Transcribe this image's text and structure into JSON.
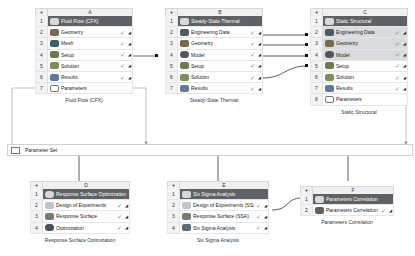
{
  "systems": {
    "A": {
      "letter": "A",
      "caption": "Fluid Flow (CFX)",
      "rows": [
        {
          "num": "1",
          "label": "Fluid Flow (CFX)",
          "icon": "fluid-flow-icon"
        },
        {
          "num": "2",
          "label": "Geometry",
          "icon": "geometry-icon",
          "check": "✓",
          "corner": "◢"
        },
        {
          "num": "3",
          "label": "Mesh",
          "icon": "mesh-icon",
          "check": "✓",
          "corner": "◢"
        },
        {
          "num": "4",
          "label": "Setup",
          "icon": "setup-icon",
          "check": "✓",
          "corner": "◢"
        },
        {
          "num": "5",
          "label": "Solution",
          "icon": "solution-icon",
          "check": "✓",
          "corner": "◢"
        },
        {
          "num": "6",
          "label": "Results",
          "icon": "results-icon",
          "check": "✓",
          "corner": "◢"
        },
        {
          "num": "7",
          "label": "Parameters",
          "icon": "parameters-icon"
        }
      ]
    },
    "B": {
      "letter": "B",
      "caption": "Steady-State Thermal",
      "rows": [
        {
          "num": "1",
          "label": "Steady-State Thermal",
          "icon": "thermal-icon"
        },
        {
          "num": "2",
          "label": "Engineering Data",
          "icon": "engineering-data-icon",
          "check": "✓",
          "corner": "◢"
        },
        {
          "num": "3",
          "label": "Geometry",
          "icon": "geometry-icon",
          "check": "✓",
          "corner": "◢"
        },
        {
          "num": "4",
          "label": "Model",
          "icon": "model-icon",
          "check": "✓",
          "corner": "◢"
        },
        {
          "num": "5",
          "label": "Setup",
          "icon": "setup-icon",
          "check": "✓",
          "corner": "◢"
        },
        {
          "num": "6",
          "label": "Solution",
          "icon": "solution-icon",
          "check": "✓",
          "corner": "◢"
        },
        {
          "num": "7",
          "label": "Results",
          "icon": "results-icon",
          "check": "✓",
          "corner": "◢"
        }
      ]
    },
    "C": {
      "letter": "C",
      "caption": "Static Structural",
      "rows": [
        {
          "num": "1",
          "label": "Static Structural",
          "icon": "structural-icon"
        },
        {
          "num": "2",
          "label": "Engineering Data",
          "icon": "engineering-data-icon",
          "check": "✓",
          "corner": "◢"
        },
        {
          "num": "3",
          "label": "Geometry",
          "icon": "geometry-icon",
          "check": "✓",
          "corner": "◢"
        },
        {
          "num": "4",
          "label": "Model",
          "icon": "model-icon",
          "check": "✓",
          "corner": "◢"
        },
        {
          "num": "5",
          "label": "Setup",
          "icon": "setup-icon",
          "check": "✓",
          "corner": "◢"
        },
        {
          "num": "6",
          "label": "Solution",
          "icon": "solution-icon",
          "check": "✓",
          "corner": "◢"
        },
        {
          "num": "7",
          "label": "Results",
          "icon": "results-icon",
          "check": "✓",
          "corner": "◢"
        },
        {
          "num": "8",
          "label": "Parameters",
          "icon": "parameters-icon"
        }
      ]
    },
    "D": {
      "letter": "D",
      "caption": "Response Surface Optimization",
      "rows": [
        {
          "num": "1",
          "label": "Response Surface Optimization",
          "icon": "optimization-icon"
        },
        {
          "num": "2",
          "label": "Design of Experiments",
          "icon": "doe-icon",
          "check": "✓",
          "corner": "◢"
        },
        {
          "num": "3",
          "label": "Response Surface",
          "icon": "response-surface-icon",
          "check": "✓",
          "corner": "◢"
        },
        {
          "num": "4",
          "label": "Optimization",
          "icon": "optimization-icon",
          "check": "✓",
          "corner": "◢"
        }
      ]
    },
    "E": {
      "letter": "E",
      "caption": "Six Sigma Analysis",
      "rows": [
        {
          "num": "1",
          "label": "Six Sigma Analysis",
          "icon": "six-sigma-icon"
        },
        {
          "num": "2",
          "label": "Design of Experiments (SSA)",
          "icon": "doe-icon",
          "check": "✓",
          "corner": "◢"
        },
        {
          "num": "3",
          "label": "Response Surface (SSA)",
          "icon": "response-surface-icon",
          "check": "✓",
          "corner": "◢"
        },
        {
          "num": "4",
          "label": "Six Sigma Analysis",
          "icon": "six-sigma-icon",
          "check": "✓",
          "corner": "◢"
        }
      ]
    },
    "F": {
      "letter": "F",
      "caption": "Parameters Correlation",
      "rows": [
        {
          "num": "1",
          "label": "Parameters Correlation",
          "icon": "parameters-correlation-icon"
        },
        {
          "num": "2",
          "label": "Parameters Correlation",
          "icon": "parameters-correlation-icon",
          "check": "✓",
          "corner": "◢"
        }
      ]
    }
  },
  "parameter_set": {
    "label": "Parameter Set"
  },
  "header_toggle": "▼",
  "colors": {
    "title_row": "#5e6166",
    "linked_row": "#d9dbde",
    "header_bg": "#eef0f2",
    "line": "#333333"
  }
}
